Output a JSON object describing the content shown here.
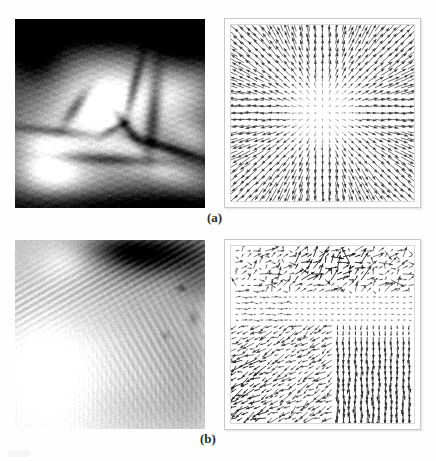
{
  "figure": {
    "kind": "scanned-journal-figure",
    "background_color": "#fefefe",
    "panels": [
      {
        "id": "a",
        "caption": "(a)",
        "left_image": {
          "name": "cardiac-mr-slice",
          "description": "Grayscale magnetic-resonance style slice: bright mid-gray ventricle blob surrounded by dark vessel branches and black background bands.",
          "tone": "high-contrast dark background, light center"
        },
        "right_plot": {
          "name": "radial-expansion-vector-field",
          "description": "Dense quiver plot; every arrow points radially outward from the plot centre, arrow length grows with distance from centre, near-zero vectors at the middle.",
          "grid": "27 x 27 sample lattice",
          "frame_color": "#c9c9c9"
        }
      },
      {
        "id": "b",
        "caption": "(b)",
        "left_image": {
          "name": "textured-ridge-image",
          "description": "Light grayscale textured image: bright smooth lower-left wedge, striated ridge running from left to upper-right, dark cloud band in the upper-right corner, soft bright highlight upper-left.",
          "tone": "mostly light gray with dark upper-right band"
        },
        "right_plot": {
          "name": "irregular-motion-vector-field",
          "description": "Dense quiver plot of an estimated non-rigid motion field: short up-right arrows and clustered dark bursts across the top band, a nearly flat low-magnitude mid band, long down-left diagonal arrows in the lower-left quadrant, and strong near-vertical downward arrows filling the lower-right quadrant.",
          "grid": "30 x 30 sample lattice",
          "frame_color": "#c9c9c9"
        }
      }
    ]
  },
  "chart_data": {
    "type": "scatter",
    "title": "",
    "xlabel": "",
    "ylabel": "",
    "charts": [
      {
        "id": "vector-field-a",
        "type": "quiver",
        "model": "radial",
        "samples": 27,
        "xlim": [
          0,
          1
        ],
        "ylim": [
          0,
          1
        ],
        "center": [
          0.5,
          0.5
        ],
        "magnitude_rule": "|v| proportional to distance from centre, saturating near the border",
        "max_arrow_length_px": 13,
        "direction_rule": "outward along the radius (divergent / expanding field)",
        "grid": false,
        "legend": "none"
      },
      {
        "id": "vector-field-b",
        "type": "quiver",
        "model": "piecewise-regional",
        "samples": 30,
        "xlim": [
          0,
          1
        ],
        "ylim": [
          0,
          1
        ],
        "regions": [
          {
            "name": "top-band",
            "y_range": [
              0.0,
              0.28
            ],
            "mean_direction_deg": 35,
            "mean_magnitude": 0.75,
            "noise": "high"
          },
          {
            "name": "mid-band",
            "y_range": [
              0.28,
              0.45
            ],
            "mean_direction_deg": 5,
            "mean_magnitude": 0.18,
            "noise": "low"
          },
          {
            "name": "lower-left",
            "x_range": [
              0.0,
              0.55
            ],
            "y_range": [
              0.45,
              1.0
            ],
            "mean_direction_deg": 215,
            "mean_magnitude": 0.7,
            "noise": "medium"
          },
          {
            "name": "lower-right",
            "x_range": [
              0.55,
              1.0
            ],
            "y_range": [
              0.42,
              1.0
            ],
            "mean_direction_deg": 268,
            "mean_magnitude": 0.8,
            "noise": "low"
          }
        ],
        "max_arrow_length_px": 12,
        "grid": false,
        "legend": "none"
      }
    ]
  }
}
